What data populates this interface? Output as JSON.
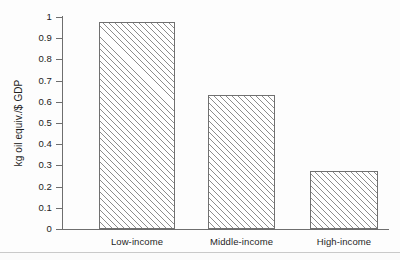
{
  "chart_data": {
    "type": "bar",
    "title": "",
    "subtitle": "",
    "xlabel": "",
    "ylabel": "kg oil equiv./$ GDP",
    "categories": [
      "Low-income",
      "Middle-income",
      "High-income"
    ],
    "values": [
      0.975,
      0.63,
      0.275
    ],
    "series": [
      {
        "name": "Energy intensity",
        "values": [
          0.975,
          0.63,
          0.275
        ]
      }
    ],
    "ylim": [
      0,
      1
    ],
    "ytick_values": [
      0,
      0.1,
      0.2,
      0.3,
      0.4,
      0.5,
      0.6,
      0.7,
      0.8,
      0.9,
      1
    ],
    "ytick_labels": [
      "0",
      "0.1",
      "0.2",
      "0.3",
      "0.4",
      "0.5",
      "0.6",
      "0.7",
      "0.8",
      "0.9",
      "1"
    ],
    "grid": false,
    "legend": false,
    "legend_position": "none",
    "bar_fill": "diagonal-hatch",
    "bar_fill_color": "#ffffff",
    "bar_edge_color": "#707070",
    "hatch_color": "#787878",
    "axis_color": "#6e6e6e",
    "background_color": "#fdfdfd",
    "text_color": "#1f1f1f"
  },
  "axis": {
    "y_title": "kg oil equiv./$ GDP"
  },
  "ticks": {
    "y": [
      {
        "label": "1",
        "value": 1
      },
      {
        "label": "0.9",
        "value": 0.9
      },
      {
        "label": "0.8",
        "value": 0.8
      },
      {
        "label": "0.7",
        "value": 0.7
      },
      {
        "label": "0.6",
        "value": 0.6
      },
      {
        "label": "0.5",
        "value": 0.5
      },
      {
        "label": "0.4",
        "value": 0.4
      },
      {
        "label": "0.3",
        "value": 0.3
      },
      {
        "label": "0.2",
        "value": 0.2
      },
      {
        "label": "0.1",
        "value": 0.1
      },
      {
        "label": "0",
        "value": 0
      }
    ]
  },
  "bars": [
    {
      "label": "Low-income",
      "value": 0.975,
      "left": 36,
      "width": 76
    },
    {
      "label": "Middle-income",
      "value": 0.63,
      "left": 145,
      "width": 67
    },
    {
      "label": "High-income",
      "value": 0.275,
      "left": 247,
      "width": 68
    }
  ]
}
